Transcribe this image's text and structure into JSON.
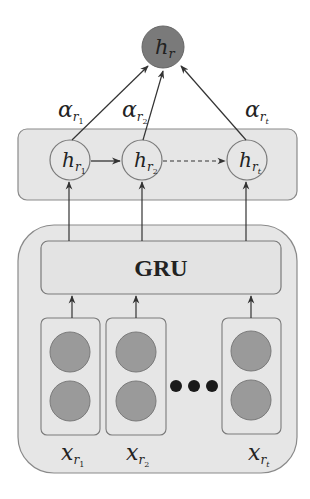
{
  "diagram": {
    "type": "GRU attention architecture",
    "output_node": {
      "base": "h",
      "sub": "r"
    },
    "attention_weights": [
      {
        "base": "α",
        "sub": "r",
        "subsub": "1"
      },
      {
        "base": "α",
        "sub": "r",
        "subsub": "2"
      },
      {
        "base": "α",
        "sub": "r",
        "subsub": "t"
      }
    ],
    "hidden_states": [
      {
        "base": "h",
        "sub": "r",
        "subsub": "1"
      },
      {
        "base": "h",
        "sub": "r",
        "subsub": "2"
      },
      {
        "base": "h",
        "sub": "r",
        "subsub": "t"
      }
    ],
    "gru_label": "GRU",
    "inputs": [
      {
        "base": "x",
        "sub": "r",
        "subsub": "1"
      },
      {
        "base": "x",
        "sub": "r",
        "subsub": "2"
      },
      {
        "base": "x",
        "sub": "r",
        "subsub": "t"
      }
    ],
    "ellipsis": "•••",
    "colors": {
      "panel_fill": "#e6e6e6",
      "panel_stroke": "#8a8a8a",
      "node_fill_dark": "#7a7a7a",
      "input_circle_fill": "#9a9a9a",
      "line": "#333333",
      "dot": "#1a1a1a"
    }
  }
}
